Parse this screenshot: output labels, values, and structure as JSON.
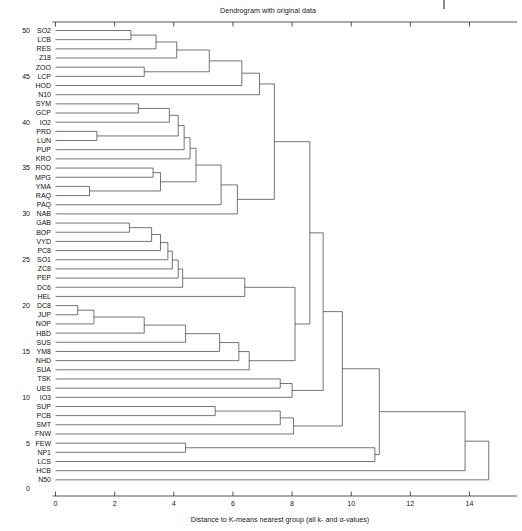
{
  "chart_data": {
    "type": "dendrogram",
    "title": "Dendrogram with original data",
    "xlabel": "Distance to K-means nearest group (all k- and α-values)",
    "ylabel": "",
    "xlim": [
      0,
      15.2
    ],
    "xticks": [
      0,
      2,
      4,
      6,
      8,
      10,
      12,
      14
    ],
    "xticklabels": [
      "0",
      "2",
      "4",
      "6",
      "8",
      "10",
      "12",
      "14"
    ],
    "grid": false,
    "legend": null,
    "orientation": "horizontal-left-to-right",
    "leaf_count": 50,
    "leaf_index_ticks": [
      50,
      45,
      40,
      35,
      30,
      25,
      20,
      15,
      10,
      5,
      0
    ],
    "leaves": [
      {
        "index": 50,
        "label": "SO2"
      },
      {
        "index": 49,
        "label": "LCB"
      },
      {
        "index": 48,
        "label": "RES"
      },
      {
        "index": 47,
        "label": "Z18"
      },
      {
        "index": 46,
        "label": "ZOO"
      },
      {
        "index": 45,
        "label": "LCP"
      },
      {
        "index": 44,
        "label": "HOD"
      },
      {
        "index": 43,
        "label": "N10"
      },
      {
        "index": 42,
        "label": "SYM"
      },
      {
        "index": 41,
        "label": "GCP"
      },
      {
        "index": 40,
        "label": "IO2"
      },
      {
        "index": 39,
        "label": "PRD"
      },
      {
        "index": 38,
        "label": "LUN"
      },
      {
        "index": 37,
        "label": "PUP"
      },
      {
        "index": 36,
        "label": "KRO"
      },
      {
        "index": 35,
        "label": "ROD"
      },
      {
        "index": 34,
        "label": "MPG"
      },
      {
        "index": 33,
        "label": "YMA"
      },
      {
        "index": 32,
        "label": "RAQ"
      },
      {
        "index": 31,
        "label": "PAQ"
      },
      {
        "index": 30,
        "label": "NAB"
      },
      {
        "index": 29,
        "label": "GAB"
      },
      {
        "index": 28,
        "label": "BOP"
      },
      {
        "index": 27,
        "label": "VYD"
      },
      {
        "index": 26,
        "label": "PC8"
      },
      {
        "index": 25,
        "label": "SO1"
      },
      {
        "index": 24,
        "label": "ZC8"
      },
      {
        "index": 23,
        "label": "PEP"
      },
      {
        "index": 22,
        "label": "DC6"
      },
      {
        "index": 21,
        "label": "HEL"
      },
      {
        "index": 20,
        "label": "DC8"
      },
      {
        "index": 19,
        "label": "JUP"
      },
      {
        "index": 18,
        "label": "NOP"
      },
      {
        "index": 17,
        "label": "HBD"
      },
      {
        "index": 16,
        "label": "SUS"
      },
      {
        "index": 15,
        "label": "YM8"
      },
      {
        "index": 14,
        "label": "NHD"
      },
      {
        "index": 13,
        "label": "SUA"
      },
      {
        "index": 12,
        "label": "TSK"
      },
      {
        "index": 11,
        "label": "UES"
      },
      {
        "index": 10,
        "label": "IO3"
      },
      {
        "index": 9,
        "label": "SUP"
      },
      {
        "index": 8,
        "label": "PCB"
      },
      {
        "index": 7,
        "label": "SMT"
      },
      {
        "index": 6,
        "label": "FNW"
      },
      {
        "index": 5,
        "label": "FEW"
      },
      {
        "index": 4,
        "label": "NP1"
      },
      {
        "index": 3,
        "label": "LCS"
      },
      {
        "index": 2,
        "label": "HCB"
      },
      {
        "index": 1,
        "label": "N50"
      }
    ],
    "merges": [
      {
        "id": "m1",
        "a": {
          "leaf": 0
        },
        "b": {
          "leaf": 1
        },
        "dist": 2.55
      },
      {
        "id": "m2",
        "a": {
          "node": "m1"
        },
        "b": {
          "leaf": 2
        },
        "dist": 3.4
      },
      {
        "id": "m3",
        "a": {
          "node": "m2"
        },
        "b": {
          "leaf": 3
        },
        "dist": 4.1
      },
      {
        "id": "m4",
        "a": {
          "leaf": 4
        },
        "b": {
          "leaf": 5
        },
        "dist": 3.0
      },
      {
        "id": "m5",
        "a": {
          "node": "m3"
        },
        "b": {
          "node": "m4"
        },
        "dist": 5.2
      },
      {
        "id": "m6",
        "a": {
          "node": "m5"
        },
        "b": {
          "leaf": 6
        },
        "dist": 6.3
      },
      {
        "id": "m7",
        "a": {
          "node": "m6"
        },
        "b": {
          "leaf": 7
        },
        "dist": 6.9
      },
      {
        "id": "m8",
        "a": {
          "leaf": 8
        },
        "b": {
          "leaf": 9
        },
        "dist": 2.8
      },
      {
        "id": "m9",
        "a": {
          "node": "m8"
        },
        "b": {
          "leaf": 10
        },
        "dist": 3.85
      },
      {
        "id": "m10",
        "a": {
          "leaf": 11
        },
        "b": {
          "leaf": 12
        },
        "dist": 1.4
      },
      {
        "id": "m11",
        "a": {
          "node": "m10"
        },
        "b": {
          "node": "m9"
        },
        "dist": 4.15
      },
      {
        "id": "m12",
        "a": {
          "node": "m11"
        },
        "b": {
          "leaf": 13
        },
        "dist": 4.35
      },
      {
        "id": "m13",
        "a": {
          "node": "m12"
        },
        "b": {
          "leaf": 14
        },
        "dist": 4.55
      },
      {
        "id": "m14",
        "a": {
          "leaf": 15
        },
        "b": {
          "leaf": 16
        },
        "dist": 3.3
      },
      {
        "id": "m15",
        "a": {
          "leaf": 17
        },
        "b": {
          "leaf": 18
        },
        "dist": 1.15
      },
      {
        "id": "m16",
        "a": {
          "node": "m15"
        },
        "b": {
          "node": "m14"
        },
        "dist": 3.55
      },
      {
        "id": "m17",
        "a": {
          "node": "m16"
        },
        "b": {
          "node": "m13"
        },
        "dist": 4.75
      },
      {
        "id": "m18",
        "a": {
          "node": "m17"
        },
        "b": {
          "leaf": 19
        },
        "dist": 5.6
      },
      {
        "id": "m19",
        "a": {
          "node": "m18"
        },
        "b": {
          "leaf": 20
        },
        "dist": 6.15
      },
      {
        "id": "m20",
        "a": {
          "node": "m7"
        },
        "b": {
          "node": "m19"
        },
        "dist": 7.4
      },
      {
        "id": "m21",
        "a": {
          "leaf": 21
        },
        "b": {
          "leaf": 22
        },
        "dist": 2.5
      },
      {
        "id": "m22",
        "a": {
          "node": "m21"
        },
        "b": {
          "leaf": 23
        },
        "dist": 3.25
      },
      {
        "id": "m23",
        "a": {
          "node": "m22"
        },
        "b": {
          "leaf": 24
        },
        "dist": 3.55
      },
      {
        "id": "m24",
        "a": {
          "node": "m23"
        },
        "b": {
          "leaf": 25
        },
        "dist": 3.8
      },
      {
        "id": "m25",
        "a": {
          "node": "m24"
        },
        "b": {
          "leaf": 26
        },
        "dist": 3.95
      },
      {
        "id": "m26",
        "a": {
          "node": "m25"
        },
        "b": {
          "leaf": 27
        },
        "dist": 4.15
      },
      {
        "id": "m27",
        "a": {
          "node": "m26"
        },
        "b": {
          "leaf": 28
        },
        "dist": 4.3
      },
      {
        "id": "m28",
        "a": {
          "node": "m27"
        },
        "b": {
          "leaf": 29
        },
        "dist": 6.4
      },
      {
        "id": "m29",
        "a": {
          "leaf": 30
        },
        "b": {
          "leaf": 31
        },
        "dist": 0.75
      },
      {
        "id": "m30",
        "a": {
          "node": "m29"
        },
        "b": {
          "leaf": 32
        },
        "dist": 1.3
      },
      {
        "id": "m31",
        "a": {
          "node": "m30"
        },
        "b": {
          "leaf": 33
        },
        "dist": 3.0
      },
      {
        "id": "m32",
        "a": {
          "node": "m31"
        },
        "b": {
          "leaf": 34
        },
        "dist": 4.4
      },
      {
        "id": "m33",
        "a": {
          "node": "m32"
        },
        "b": {
          "leaf": 35
        },
        "dist": 5.55
      },
      {
        "id": "m34",
        "a": {
          "node": "m33"
        },
        "b": {
          "leaf": 36
        },
        "dist": 6.2
      },
      {
        "id": "m35",
        "a": {
          "node": "m34"
        },
        "b": {
          "leaf": 37
        },
        "dist": 6.55
      },
      {
        "id": "m36",
        "a": {
          "node": "m28"
        },
        "b": {
          "node": "m35"
        },
        "dist": 8.1
      },
      {
        "id": "m37",
        "a": {
          "node": "m20"
        },
        "b": {
          "node": "m36"
        },
        "dist": 8.6
      },
      {
        "id": "m38",
        "a": {
          "leaf": 38
        },
        "b": {
          "leaf": 39
        },
        "dist": 7.6
      },
      {
        "id": "m39",
        "a": {
          "node": "m38"
        },
        "b": {
          "leaf": 40
        },
        "dist": 8.0
      },
      {
        "id": "m40",
        "a": {
          "node": "m39"
        },
        "b": {
          "node": "m37"
        },
        "dist": 9.05
      },
      {
        "id": "m41",
        "a": {
          "leaf": 41
        },
        "b": {
          "leaf": 42
        },
        "dist": 5.4
      },
      {
        "id": "m42",
        "a": {
          "node": "m41"
        },
        "b": {
          "leaf": 43
        },
        "dist": 7.6
      },
      {
        "id": "m43",
        "a": {
          "node": "m42"
        },
        "b": {
          "leaf": 44
        },
        "dist": 8.05
      },
      {
        "id": "m44",
        "a": {
          "node": "m43"
        },
        "b": {
          "node": "m40"
        },
        "dist": 9.7
      },
      {
        "id": "m45",
        "a": {
          "leaf": 45
        },
        "b": {
          "leaf": 46
        },
        "dist": 4.4
      },
      {
        "id": "m46",
        "a": {
          "node": "m45"
        },
        "b": {
          "leaf": 47
        },
        "dist": 10.8
      },
      {
        "id": "m47",
        "a": {
          "node": "m46"
        },
        "b": {
          "node": "m44"
        },
        "dist": 10.95
      },
      {
        "id": "m48",
        "a": {
          "node": "m47"
        },
        "b": {
          "leaf": 48
        },
        "dist": 13.85
      },
      {
        "id": "m49",
        "a": {
          "node": "m48"
        },
        "b": {
          "leaf": 49
        },
        "dist": 14.65
      }
    ]
  },
  "plot": {
    "title_text": "Dendrogram with original data",
    "xaxis_title": "Distance to K-means nearest group (all k- and α-values)",
    "line_color": "#3a3a3a",
    "axis_color": "#2b2b2b",
    "background": "#ffffff"
  }
}
